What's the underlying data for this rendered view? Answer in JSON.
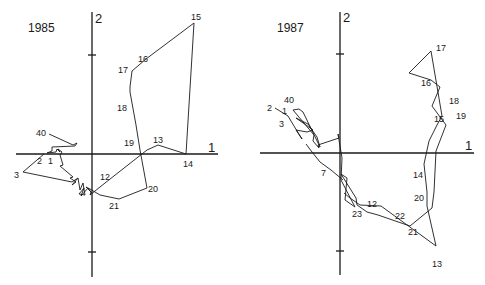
{
  "panels": [
    {
      "title": "1985",
      "axis_x_label": "1",
      "axis_y_label": "2",
      "point_labels": [
        "40",
        "1",
        "2",
        "3",
        "12",
        "13",
        "14",
        "15",
        "16",
        "17",
        "18",
        "19",
        "20",
        "21"
      ]
    },
    {
      "title": "1987",
      "axis_x_label": "1",
      "axis_y_label": "2",
      "point_labels": [
        "40",
        "1",
        "2",
        "3",
        "7",
        "12",
        "13",
        "14",
        "15",
        "16",
        "17",
        "18",
        "19",
        "20",
        "21",
        "22",
        "23"
      ]
    }
  ],
  "colors": {
    "ink": "#1a1a1a",
    "background": "#ffffff"
  }
}
